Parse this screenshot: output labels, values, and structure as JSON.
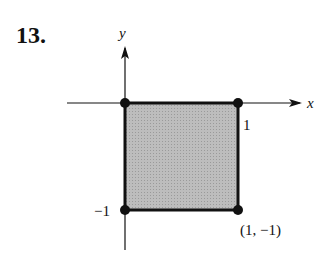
{
  "problem_number": "13.",
  "axes": {
    "x_label": "x",
    "y_label": "y"
  },
  "region": {
    "shape": "square",
    "fill": "#b8b8b8",
    "edge": "#111111",
    "vertices": [
      [
        0,
        0
      ],
      [
        1,
        0
      ],
      [
        1,
        -1
      ],
      [
        0,
        -1
      ]
    ]
  },
  "labels": {
    "tick_x": "1",
    "tick_y": "−1",
    "point": "(1, −1)"
  }
}
